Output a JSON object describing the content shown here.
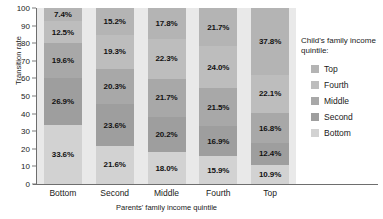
{
  "chart_data": {
    "type": "bar",
    "subtype": "stacked-percentage-column",
    "title": "",
    "xlabel": "Parents' family income quintile",
    "ylabel": "Transition rate",
    "ylim": [
      0,
      100
    ],
    "yticks": [
      0,
      10,
      20,
      30,
      40,
      50,
      60,
      70,
      80,
      90,
      100
    ],
    "grid": false,
    "legend_position": "right",
    "legend_title": "Child's family income quintile:",
    "categories": [
      "Bottom",
      "Second",
      "Middle",
      "Fourth",
      "Top"
    ],
    "series": [
      {
        "name": "Top",
        "color": "#b4b4b4",
        "values": [
          7.4,
          15.2,
          17.8,
          21.7,
          37.8
        ],
        "labels": [
          "7.4%",
          "15.2%",
          "17.8%",
          "21.7%",
          "37.8%"
        ]
      },
      {
        "name": "Fourth",
        "color": "#bdbdbd",
        "values": [
          12.5,
          19.3,
          22.3,
          24.0,
          22.1
        ],
        "labels": [
          "12.5%",
          "19.3%",
          "22.3%",
          "24.0%",
          "22.1%"
        ]
      },
      {
        "name": "Middle",
        "color": "#a8a8a8",
        "values": [
          19.6,
          20.3,
          21.7,
          21.5,
          16.8
        ],
        "labels": [
          "19.6%",
          "20.3%",
          "21.7%",
          "21.5%",
          "16.8%"
        ]
      },
      {
        "name": "Second",
        "color": "#9e9e9e",
        "values": [
          26.9,
          23.6,
          20.2,
          16.9,
          12.4
        ],
        "labels": [
          "26.9%",
          "23.6%",
          "20.2%",
          "16.9%",
          "12.4%"
        ]
      },
      {
        "name": "Bottom",
        "color": "#d2d2d2",
        "values": [
          33.6,
          21.6,
          18.0,
          15.9,
          10.9
        ],
        "labels": [
          "33.6%",
          "21.6%",
          "18.0%",
          "15.9%",
          "10.9%"
        ]
      }
    ],
    "panel_background": "#e9e9e9",
    "axis_color": "#6e6e6e"
  },
  "axis": {
    "y_title": "Transition rate",
    "x_title": "Parents' family income quintile",
    "y_tick_labels": [
      "100",
      "90",
      "80",
      "70",
      "60",
      "50",
      "40",
      "30",
      "20",
      "10",
      "0"
    ]
  },
  "legend": {
    "title": "Child's family income quintile:",
    "items": [
      {
        "label": "Top",
        "color": "#b4b4b4"
      },
      {
        "label": "Fourth",
        "color": "#bdbdbd"
      },
      {
        "label": "Middle",
        "color": "#a8a8a8"
      },
      {
        "label": "Second",
        "color": "#9e9e9e"
      },
      {
        "label": "Bottom",
        "color": "#d2d2d2"
      }
    ]
  }
}
